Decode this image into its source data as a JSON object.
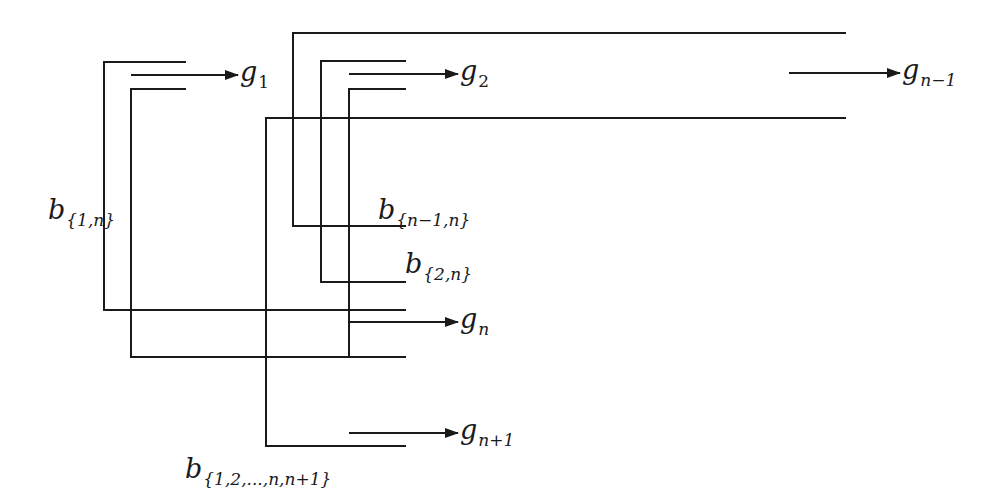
{
  "diagram": {
    "type": "circuit-style bus diagram",
    "stroke_color": "#1a1a1a",
    "background_color": "#ffffff",
    "outputs": [
      {
        "id": "g1",
        "base": "g",
        "sub": "1",
        "arrow_y": 75,
        "arrow_x1": 131,
        "arrow_x2": 238,
        "label_x": 240,
        "label_y": 58
      },
      {
        "id": "g2",
        "base": "g",
        "sub": "2",
        "arrow_y": 74,
        "arrow_x1": 349,
        "arrow_x2": 458,
        "label_x": 460,
        "label_y": 57
      },
      {
        "id": "gn-1",
        "base": "g",
        "sub": "n−1",
        "arrow_y": 73,
        "arrow_x1": 789,
        "arrow_x2": 900,
        "label_x": 902,
        "label_y": 56
      },
      {
        "id": "gn",
        "base": "g",
        "sub": "n",
        "arrow_y": 322,
        "arrow_x1": 349,
        "arrow_x2": 458,
        "label_x": 460,
        "label_y": 305
      },
      {
        "id": "gn+1",
        "base": "g",
        "sub": "n+1",
        "arrow_y": 433,
        "arrow_x1": 349,
        "arrow_x2": 458,
        "label_x": 460,
        "label_y": 416
      }
    ],
    "buses": [
      {
        "id": "b1n",
        "base": "b",
        "sub": "{1,n}",
        "label_x": 48,
        "label_y": 196
      },
      {
        "id": "bn-1n",
        "base": "b",
        "sub": "{n−1,n}",
        "label_x": 378,
        "label_y": 196
      },
      {
        "id": "b2n",
        "base": "b",
        "sub": "{2,n}",
        "label_x": 405,
        "label_y": 250
      },
      {
        "id": "b12nn1",
        "base": "b",
        "sub": "{1,2,...,n,n+1}",
        "label_x": 185,
        "label_y": 455
      }
    ]
  }
}
